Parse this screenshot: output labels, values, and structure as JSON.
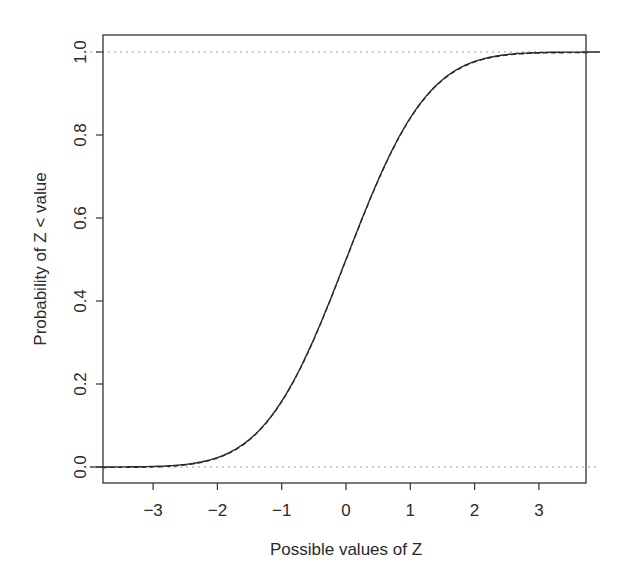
{
  "chart_data": {
    "type": "line",
    "title": "",
    "xlabel": "Possible values of Z",
    "ylabel": "Probability of Z < value",
    "xlim": [
      -3.8,
      3.8
    ],
    "ylim": [
      -0.04,
      1.04
    ],
    "x_ticks": [
      -3,
      -2,
      -1,
      0,
      1,
      2,
      3
    ],
    "x_tick_labels": [
      "−3",
      "−2",
      "−1",
      "0",
      "1",
      "2",
      "3"
    ],
    "y_ticks": [
      0.0,
      0.2,
      0.4,
      0.6,
      0.8,
      1.0
    ],
    "y_tick_labels": [
      "0.0",
      "0.2",
      "0.4",
      "0.6",
      "0.8",
      "1.0"
    ],
    "grid": false,
    "legend": null,
    "reference_lines": [
      {
        "y": 0.0,
        "style": "dotted",
        "color": "#9a9a9a"
      },
      {
        "y": 1.0,
        "style": "dotted",
        "color": "#9a9a9a"
      }
    ],
    "series": [
      {
        "name": "Standard normal CDF (solid)",
        "style": "solid",
        "color": "#2a2a2a",
        "x": [
          -3.8,
          -3.0,
          -2.5,
          -2.0,
          -1.5,
          -1.0,
          -0.5,
          0.0,
          0.5,
          1.0,
          1.5,
          2.0,
          2.5,
          3.0,
          3.8
        ],
        "y": [
          0.0001,
          0.0013,
          0.0062,
          0.0228,
          0.0668,
          0.1587,
          0.3085,
          0.5,
          0.6915,
          0.8413,
          0.9332,
          0.9772,
          0.9938,
          0.9987,
          0.9999
        ]
      },
      {
        "name": "Empirical CDF (dashed)",
        "style": "dashed",
        "color": "#2a2a2a",
        "x": [
          -3.8,
          -3.0,
          -2.5,
          -2.0,
          -1.5,
          -1.0,
          -0.5,
          0.0,
          0.5,
          1.0,
          1.5,
          2.0,
          2.5,
          3.0,
          3.8
        ],
        "y": [
          0.0,
          0.0015,
          0.0065,
          0.023,
          0.067,
          0.158,
          0.309,
          0.5,
          0.692,
          0.841,
          0.933,
          0.977,
          0.994,
          0.999,
          1.0
        ]
      }
    ]
  }
}
